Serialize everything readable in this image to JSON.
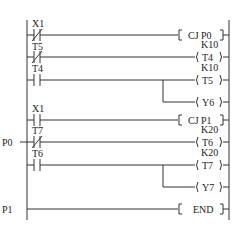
{
  "diagram": {
    "type": "ladder",
    "rails": {
      "left_x": 27,
      "right_x": 229,
      "top_y": 20,
      "bottom_y": 219
    },
    "rungs": [
      {
        "y": 35,
        "contact": {
          "label": "X1",
          "type": "NC"
        },
        "output": {
          "kind": "box",
          "text": "CJ  P0"
        }
      },
      {
        "y": 57,
        "contact": {
          "label": "T5",
          "type": "NC"
        },
        "output": {
          "kind": "coil",
          "text": "T4",
          "preset": "K10"
        }
      },
      {
        "y": 80,
        "contact": {
          "label": "T4",
          "type": "NO"
        },
        "output": {
          "kind": "coil",
          "text": "T5",
          "preset": "K10"
        }
      },
      {
        "y": 102,
        "branch": true,
        "output": {
          "kind": "coil",
          "text": "Y6"
        }
      },
      {
        "y": 120,
        "contact": {
          "label": "X1",
          "type": "NO"
        },
        "output": {
          "kind": "box",
          "text": "CJ  P1"
        }
      },
      {
        "y": 142,
        "pointer": "P0",
        "contact": {
          "label": "T7",
          "type": "NC"
        },
        "output": {
          "kind": "coil",
          "text": "T6",
          "preset": "K20"
        }
      },
      {
        "y": 165,
        "contact": {
          "label": "T6",
          "type": "NO"
        },
        "output": {
          "kind": "coil",
          "text": "T7",
          "preset": "K20"
        }
      },
      {
        "y": 187,
        "branch": true,
        "output": {
          "kind": "coil",
          "text": "Y7"
        }
      },
      {
        "y": 209,
        "pointer": "P1",
        "output": {
          "kind": "box",
          "text": "END"
        }
      }
    ]
  },
  "labels": {
    "r1_contact": "X1",
    "r1_out": "CJ  P0",
    "r2_contact": "T5",
    "r2_preset": "K10",
    "r2_out": "T4",
    "r3_contact": "T4",
    "r3_preset": "K10",
    "r3_out": "T5",
    "r4_out": "Y6",
    "r5_contact": "X1",
    "r5_out": "CJ  P1",
    "r6_pointer": "P0",
    "r6_contact": "T7",
    "r6_preset": "K20",
    "r6_out": "T6",
    "r7_contact": "T6",
    "r7_preset": "K20",
    "r7_out": "T7",
    "r8_out": "Y7",
    "r9_pointer": "P1",
    "r9_out": "END"
  }
}
